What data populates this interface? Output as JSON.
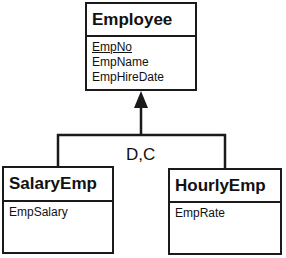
{
  "diagram": {
    "type": "UML class / EER specialization",
    "superclass": {
      "name": "Employee",
      "attributes": [
        {
          "name": "EmpNo",
          "primary_key": true
        },
        {
          "name": "EmpName",
          "primary_key": false
        },
        {
          "name": "EmpHireDate",
          "primary_key": false
        }
      ]
    },
    "subclasses": [
      {
        "name": "SalaryEmp",
        "attributes": [
          {
            "name": "EmpSalary"
          }
        ]
      },
      {
        "name": "HourlyEmp",
        "attributes": [
          {
            "name": "EmpRate"
          }
        ]
      }
    ],
    "generalization": {
      "constraint_label": "D,C",
      "arrow": "hollow-triangle-filled"
    }
  }
}
